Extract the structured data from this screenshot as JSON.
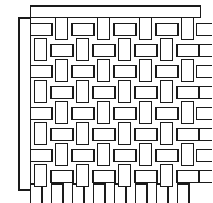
{
  "figure": {
    "background_color": "#ffffff",
    "line_color": "#1a1a1a",
    "fill_color": "#ffffff",
    "canvas": {
      "width": 212,
      "height": 203
    }
  },
  "geometry": {
    "line_width": 1.1,
    "thread_width": 11.5,
    "cell_pitch": 21.0,
    "weave_origin_x": 30.5,
    "weave_origin_y": 18.0,
    "columns": 8,
    "rows": 8,
    "weft_gap": 9.5
  },
  "selvage": {
    "left_bar": {
      "x": 19.0,
      "y": 18.0,
      "width": 11.5,
      "height": 172.0
    },
    "top_bar": {
      "x": 30.5,
      "y": 6.0,
      "width": 170.0,
      "height": 11.5
    }
  },
  "right_loose_ends": {
    "label": "loose weft thread ends",
    "lengths": [
      20,
      24,
      32,
      40,
      22,
      18,
      30,
      26
    ]
  },
  "bottom_loose_ends": {
    "label": "loose warp thread ends",
    "lengths": [
      26,
      30,
      22,
      34,
      24,
      28,
      20,
      32
    ]
  },
  "weave_pattern": {
    "type": "checkerboard",
    "horizontal_cell_label": "weft-over segment",
    "vertical_cell_label": "warp-over segment"
  }
}
